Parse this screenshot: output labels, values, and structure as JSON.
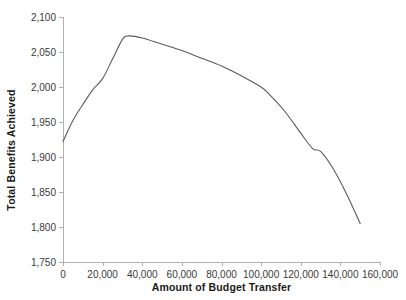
{
  "chart_data": {
    "type": "line",
    "title": "",
    "xlabel": "Amount of Budget Transfer",
    "ylabel": "Total Benefits Achieved",
    "xlim": [
      0,
      160000
    ],
    "ylim": [
      1750,
      2100
    ],
    "grid": false,
    "legend": "none",
    "line_color": "#5a5a5a",
    "axis_color": "#b0b0b0",
    "x_ticks": [
      0,
      20000,
      40000,
      60000,
      80000,
      100000,
      120000,
      140000,
      160000
    ],
    "x_tick_labels": [
      "0",
      "20,000",
      "40,000",
      "60,000",
      "80,000",
      "100,000",
      "120,000",
      "140,000",
      "160,000"
    ],
    "y_ticks": [
      1750,
      1800,
      1850,
      1900,
      1950,
      2000,
      2050,
      2100
    ],
    "y_tick_labels": [
      "1,750",
      "1,800",
      "1,850",
      "1,900",
      "1,950",
      "2,000",
      "2,050",
      "2,100"
    ],
    "series": [
      {
        "name": "Total Benefits Achieved",
        "x": [
          0,
          5000,
          10000,
          15000,
          20000,
          25000,
          30000,
          33000,
          40000,
          50000,
          60000,
          70000,
          80000,
          90000,
          100000,
          105000,
          112000,
          120000,
          126000,
          130000,
          136000,
          143000,
          150000
        ],
        "values": [
          1922,
          1952,
          1975,
          1996,
          2012,
          2040,
          2068,
          2073,
          2070,
          2061,
          2052,
          2041,
          2030,
          2016,
          2000,
          1987,
          1965,
          1934,
          1912,
          1908,
          1885,
          1848,
          1805
        ]
      }
    ]
  }
}
